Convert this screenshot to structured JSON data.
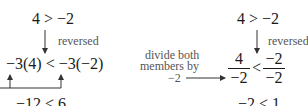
{
  "left_example": {
    "original": "4 > −2",
    "note": "reversed",
    "multiplied": "−3(4) < −3(−2)",
    "result": "−12 < 6"
  },
  "right_example": {
    "original": "4 > −2",
    "note": "reversed",
    "operation_line1": "divide both",
    "operation_line2": "members by",
    "operation_line3": "−2",
    "lhs_num": "4",
    "lhs_den": "−2",
    "relation": "<",
    "rhs_num": "−2",
    "rhs_den": "−2",
    "result": "−2 < 1"
  },
  "colors": {
    "text": "#1a1a1a",
    "note": "#555555",
    "line": "#333333"
  }
}
